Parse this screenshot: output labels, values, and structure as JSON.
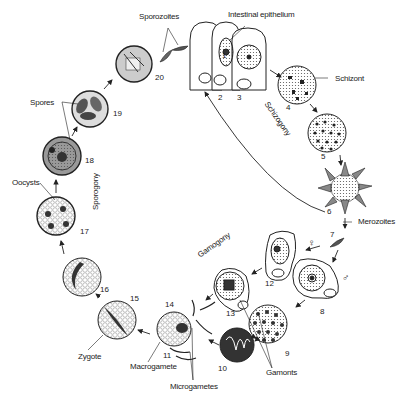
{
  "diagram": {
    "labels": {
      "sporozoites": "Sporozoites",
      "intestinal_epithelium": "Intestinal epithelium",
      "schizont": "Schizont",
      "schizogony": "Schizogony",
      "merozoites": "Merozoites",
      "gamogony": "Gamogony",
      "gamonts": "Gamonts",
      "macrogamete": "Macrogamete",
      "microgametes": "Microgametes",
      "zygote": "Zygote",
      "oocysts": "Oocysts",
      "spores": "Spores",
      "sporogony": "Sporogony",
      "female_symbol": "♀",
      "male_symbol": "♂"
    },
    "stages": [
      {
        "n": "1",
        "x": 222,
        "y": 51
      },
      {
        "n": "2",
        "x": 218,
        "y": 93
      },
      {
        "n": "3",
        "x": 237,
        "y": 93
      },
      {
        "n": "4",
        "x": 286,
        "y": 103
      },
      {
        "n": "5",
        "x": 321,
        "y": 152
      },
      {
        "n": "6",
        "x": 327,
        "y": 207
      },
      {
        "n": "7",
        "x": 330,
        "y": 230
      },
      {
        "n": "8",
        "x": 320,
        "y": 307
      },
      {
        "n": "9",
        "x": 285,
        "y": 349
      },
      {
        "n": "10",
        "x": 218,
        "y": 364
      },
      {
        "n": "11",
        "x": 163,
        "y": 351
      },
      {
        "n": "12",
        "x": 265,
        "y": 279
      },
      {
        "n": "13",
        "x": 226,
        "y": 309
      },
      {
        "n": "14",
        "x": 165,
        "y": 300
      },
      {
        "n": "15",
        "x": 130,
        "y": 294
      },
      {
        "n": "16",
        "x": 100,
        "y": 285
      },
      {
        "n": "17",
        "x": 80,
        "y": 227
      },
      {
        "n": "18",
        "x": 85,
        "y": 156
      },
      {
        "n": "19",
        "x": 113,
        "y": 109
      },
      {
        "n": "20",
        "x": 155,
        "y": 73
      }
    ]
  }
}
